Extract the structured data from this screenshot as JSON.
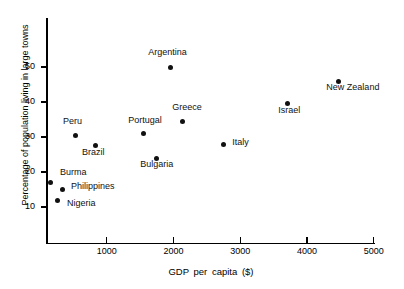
{
  "chart_data": {
    "type": "scatter",
    "title": "",
    "xlabel": "GDP  per capita  ($)",
    "ylabel": "Percentage of population living in large towns",
    "xlim": [
      0,
      5000
    ],
    "ylim": [
      0,
      57
    ],
    "grid": false,
    "legend": "none",
    "xticks": [
      1000,
      2000,
      3000,
      4000,
      5000
    ],
    "xticklabels": [
      "1000",
      "2000",
      "3000",
      "4000",
      "5000"
    ],
    "yticks": [
      10,
      20,
      30,
      40,
      50
    ],
    "yticklabels": [
      "10",
      "20",
      "30",
      "40",
      "50"
    ],
    "marker_color": "#111111",
    "points": [
      {
        "label": "Burma",
        "x": 150,
        "y": 17.0,
        "label_dx": 10,
        "label_dy": -11
      },
      {
        "label": "Nigeria",
        "x": 255,
        "y": 12.0,
        "label_dx": 10,
        "label_dy": 3
      },
      {
        "label": "Philippines",
        "x": 330,
        "y": 15.0,
        "label_dx": 9,
        "label_dy": -4
      },
      {
        "label": "Peru",
        "x": 525,
        "y": 30.5,
        "label_dx": -12,
        "label_dy": -14
      },
      {
        "label": "Brazil",
        "x": 825,
        "y": 27.5,
        "label_dx": -13,
        "label_dy": 6
      },
      {
        "label": "Portugal",
        "x": 1545,
        "y": 31.0,
        "label_dx": -15,
        "label_dy": -14
      },
      {
        "label": "Bulgaria",
        "x": 1740,
        "y": 24.0,
        "label_dx": -16,
        "label_dy": 6
      },
      {
        "label": "Greece",
        "x": 2130,
        "y": 34.5,
        "label_dx": -10,
        "label_dy": -14
      },
      {
        "label": "Argentina",
        "x": 1950,
        "y": 50.0,
        "label_dx": -22,
        "label_dy": -15
      },
      {
        "label": "Italy",
        "x": 2745,
        "y": 28.0,
        "label_dx": 9,
        "label_dy": -2
      },
      {
        "label": "Israel",
        "x": 3705,
        "y": 39.5,
        "label_dx": -9,
        "label_dy": 6
      },
      {
        "label": "New Zealand",
        "x": 4470,
        "y": 46.0,
        "label_dx": -12,
        "label_dy": 6
      }
    ]
  }
}
